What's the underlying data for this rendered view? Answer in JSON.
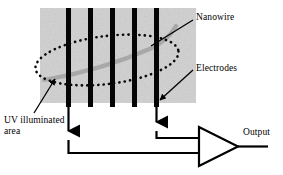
{
  "figure": {
    "labels": {
      "nanowire": "Nanowire",
      "electrodes": "Electrodes",
      "output": "Output",
      "uv_illuminated_area": "UV illuminated area"
    },
    "colors": {
      "substrate_gray": "#c8c8c8",
      "electrode_black": "#000000",
      "nanowire_gray": "#a9a9a9",
      "wire_black": "#000000",
      "background": "#ffffff",
      "text": "#000000"
    },
    "components": {
      "substrate": {
        "name": "substrate-pad",
        "x": 40,
        "y": 8,
        "width": 156,
        "height": 95
      },
      "electrodes": {
        "name": "electrode-array",
        "count": 5,
        "x_positions": [
          68,
          89,
          111,
          133,
          156
        ],
        "width": 5,
        "top": 8,
        "bottom": 107
      },
      "nanowire": {
        "name": "nanowire-curve",
        "stroke_width": 4,
        "description": "light gray curved wire crossing all electrodes"
      },
      "uv_ellipse": {
        "name": "uv-illumination-ellipse",
        "style": "dotted",
        "center_x": 107,
        "center_y": 60,
        "rx": 72,
        "ry": 24,
        "rotation_deg": -7
      },
      "amplifier": {
        "name": "amplifier-triangle",
        "left": 198,
        "right": 238,
        "top": 127,
        "bottom": 166,
        "inputs": 2,
        "output_line_end_x": 268
      },
      "wires": {
        "left_drop_x": 68,
        "left_arrow_y": 133,
        "left_rail_y": 153,
        "right_drop_x": 156,
        "right_arrow_y": 124,
        "right_rail_y": 138
      }
    },
    "leaders": [
      {
        "name": "nanowire-leader",
        "from_x": 194,
        "from_y": 19,
        "to_x": 152,
        "to_y": 45
      },
      {
        "name": "electrodes-leader",
        "from_x": 194,
        "from_y": 70,
        "to_x": 159,
        "to_y": 100
      },
      {
        "name": "uv-leader",
        "from_x": 35,
        "from_y": 112,
        "to_x": 55,
        "to_y": 79
      }
    ]
  }
}
